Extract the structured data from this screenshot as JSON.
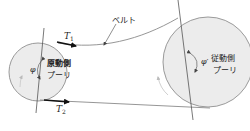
{
  "diagram": {
    "type": "belt-pulley-system",
    "colors": {
      "pulley_fill": "#ececec",
      "pulley_stroke": "#9a9a9a",
      "belt": "#8a8a8a",
      "line": "#555555",
      "arrow": "#111111",
      "text": "#222222"
    },
    "belt_label": "ベルト",
    "driving_pulley": {
      "label_line1": "原動側",
      "label_line2": "プーリ",
      "angle_symbol": "φ"
    },
    "driven_pulley": {
      "label_line1": "従動側",
      "label_line2": "プーリ",
      "angle_symbol": "φ′"
    },
    "tensions": {
      "t1_symbol": "T",
      "t1_sub": "1",
      "t2_symbol": "T",
      "t2_sub": "2"
    }
  }
}
